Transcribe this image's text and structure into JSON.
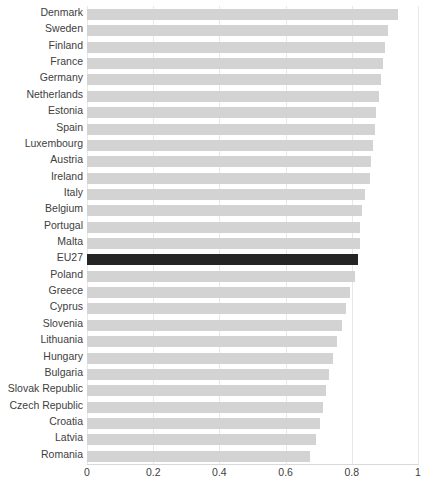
{
  "chart_data": {
    "type": "bar",
    "orientation": "horizontal",
    "title": "",
    "subtitle": "",
    "xlabel": "",
    "ylabel": "",
    "xlim": [
      0,
      1
    ],
    "xticks": [
      "0",
      "0.2",
      "0.4",
      "0.6",
      "0.8",
      "1"
    ],
    "xtick_values": [
      0,
      0.2,
      0.4,
      0.6,
      0.8,
      1
    ],
    "grid": true,
    "grid_axis": "x",
    "legend": null,
    "legend_position": "none",
    "highlight_category": "EU27",
    "colors": {
      "bar": "#d3d3d3",
      "highlight_bar": "#252525",
      "gridline": "#e8e8e8",
      "axis": "#d9d9d9",
      "label_text": "#404040",
      "background": "#ffffff"
    },
    "categories": [
      "Denmark",
      "Sweden",
      "Finland",
      "France",
      "Germany",
      "Netherlands",
      "Estonia",
      "Spain",
      "Luxembourg",
      "Austria",
      "Ireland",
      "Italy",
      "Belgium",
      "Portugal",
      "Malta",
      "EU27",
      "Poland",
      "Greece",
      "Cyprus",
      "Slovenia",
      "Lithuania",
      "Hungary",
      "Bulgaria",
      "Slovak Republic",
      "Czech Republic",
      "Croatia",
      "Latvia",
      "Romania"
    ],
    "values": [
      0.94,
      0.91,
      0.9,
      0.894,
      0.888,
      0.882,
      0.872,
      0.87,
      0.864,
      0.858,
      0.855,
      0.84,
      0.832,
      0.826,
      0.824,
      0.82,
      0.81,
      0.795,
      0.782,
      0.77,
      0.755,
      0.742,
      0.732,
      0.722,
      0.713,
      0.703,
      0.692,
      0.674
    ]
  }
}
